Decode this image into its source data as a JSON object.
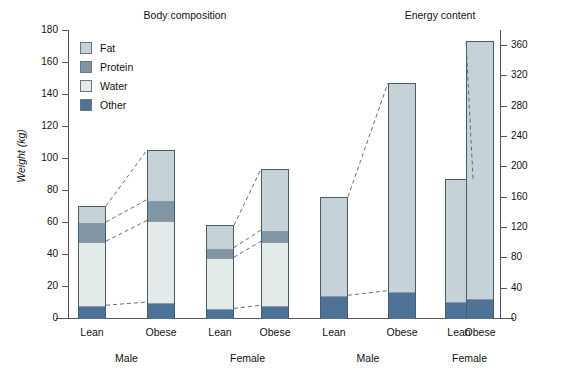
{
  "chart_data": {
    "type": "bar",
    "title": "",
    "panels": [
      {
        "title": "Body composition",
        "axis": "left",
        "ylabel": "Weight (kg)",
        "ylim": [
          0,
          180
        ],
        "yticks": [
          0,
          20,
          40,
          60,
          80,
          100,
          120,
          140,
          160,
          180
        ],
        "stacked": true,
        "series": [
          {
            "name": "Other",
            "values": [
              8,
              10,
              6,
              8
            ]
          },
          {
            "name": "Water",
            "values": [
              40,
              51,
              32,
              40
            ]
          },
          {
            "name": "Protein",
            "values": [
              12,
              13,
              6,
              7
            ]
          },
          {
            "name": "Fat",
            "values": [
              10,
              31,
              14,
              38
            ]
          }
        ],
        "totals": [
          70,
          105,
          58,
          93
        ],
        "categories": [
          "Lean",
          "Obese",
          "Lean",
          "Obese"
        ],
        "groups": [
          "Male",
          "Female"
        ]
      },
      {
        "title": "Energy content",
        "axis": "right",
        "ylabel": "",
        "ylim": [
          0,
          380
        ],
        "yticks": [
          0,
          40,
          80,
          120,
          160,
          200,
          240,
          280,
          320,
          360
        ],
        "stacked": true,
        "series": [
          {
            "name": "Other",
            "values": [
              30,
              36,
              22,
              26
            ]
          },
          {
            "name": "Fat",
            "values": [
              130,
              274,
              162,
              340
            ]
          }
        ],
        "totals": [
          160,
          310,
          184,
          366
        ],
        "categories": [
          "Lean",
          "Obese",
          "Lean",
          "Obese"
        ],
        "groups": [
          "Male",
          "Female"
        ]
      }
    ],
    "legend": {
      "position": "top-left",
      "entries": [
        {
          "label": "Fat",
          "color": "#c5d3d8"
        },
        {
          "label": "Protein",
          "color": "#8096a6"
        },
        {
          "label": "Water",
          "color": "#e3eaea"
        },
        {
          "label": "Other",
          "color": "#4f7396"
        }
      ]
    },
    "connectors": {
      "style": "dashed",
      "description": "Dashed lines join corresponding segment boundaries between the Lean and Obese bars within each sex group."
    },
    "grid": false
  },
  "axes": {
    "left": {
      "label": "Weight (kg)",
      "ticks": [
        "0",
        "20",
        "40",
        "60",
        "80",
        "100",
        "120",
        "140",
        "160",
        "180"
      ]
    },
    "right": {
      "label": "",
      "ticks": [
        "0",
        "40",
        "80",
        "120",
        "160",
        "200",
        "240",
        "280",
        "320",
        "360"
      ]
    }
  },
  "titles": {
    "left_panel": "Body composition",
    "right_panel": "Energy content"
  },
  "legend": {
    "fat": "Fat",
    "protein": "Protein",
    "water": "Water",
    "other": "Other"
  },
  "categories": {
    "lean": "Lean",
    "obese": "Obese",
    "male": "Male",
    "female": "Female"
  },
  "colors": {
    "fat": "#c5d3d8",
    "protein": "#8096a6",
    "water": "#e3eaea",
    "other": "#4f7396",
    "outline": "#4a5a66",
    "axis": "#555555"
  }
}
